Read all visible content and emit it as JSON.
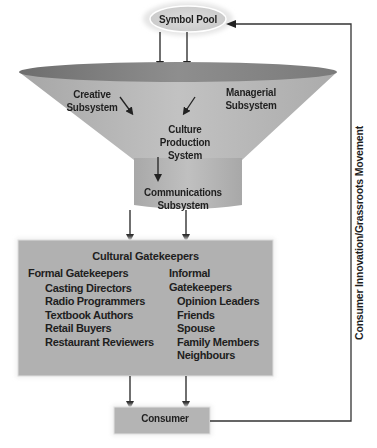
{
  "diagram": {
    "symbol_pool": "Symbol Pool",
    "culture_production_system": {
      "creative": [
        "Creative",
        "Subsystem"
      ],
      "managerial": [
        "Managerial",
        "Subsystem"
      ],
      "core": [
        "Culture",
        "Production",
        "System"
      ]
    },
    "communications": [
      "Communications",
      "Subsystem"
    ],
    "cultural_gatekeepers": {
      "title": "Cultural Gatekeepers",
      "formal": {
        "heading": "Formal Gatekeepers",
        "items": [
          "Casting Directors",
          "Radio Programmers",
          "Textbook Authors",
          "Retail Buyers",
          "Restaurant Reviewers"
        ]
      },
      "informal": {
        "heading": "Informal Gatekeepers",
        "items": [
          "Opinion Leaders",
          "Friends",
          "Spouse",
          "Family Members",
          "Neighbours"
        ]
      }
    },
    "consumer": "Consumer",
    "feedback_label": "Consumer Innovation/Grassroots Movement"
  },
  "colors": {
    "pool_fill": "#d6d6d6",
    "funnel_top": "#8a8a8a",
    "funnel_body": "#b4b4b4",
    "box_fill": "#b0b0b0",
    "line": "#222222"
  }
}
